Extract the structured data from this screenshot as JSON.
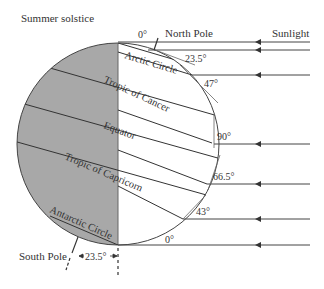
{
  "title": "Summer solstice",
  "labels": {
    "north_pole": "North Pole",
    "south_pole": "South Pole",
    "sunlight": "Sunlight"
  },
  "latitudes": {
    "arctic_circle": "Arctic Circle",
    "tropic_of_cancer": "Tropic of Cancer",
    "equator": "Equator",
    "tropic_of_capricorn": "Tropic of Capricorn",
    "antarctic_circle": "Antarctic Circle"
  },
  "angles": {
    "top": "0°",
    "arctic": "23.5°",
    "cancer": "47°",
    "equator": "90°",
    "capricorn": "66.5°",
    "antarctic": "43°",
    "bottom": "0°",
    "tilt": "23.5°"
  },
  "colors": {
    "night": "#a8a8a8",
    "line": "#333333",
    "background": "#ffffff"
  }
}
